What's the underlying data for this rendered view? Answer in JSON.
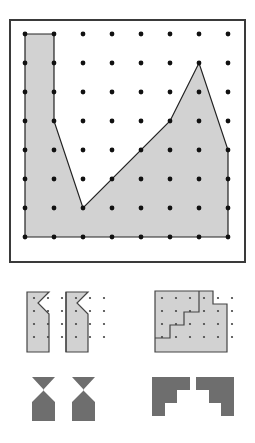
{
  "page": {
    "background_color": "#ffffff"
  },
  "palette": {
    "light_fill": "#d2d2d2",
    "dark_fill": "#6e6e6e",
    "outline": "#222222",
    "frame": "#3a3a3a",
    "dot": "#111111",
    "small_dot": "#444444"
  },
  "main_panel": {
    "label": "main-geoboard-panel",
    "frame": {
      "x": 10,
      "y": 20,
      "width": 235,
      "height": 242,
      "stroke_width": 2
    },
    "grid": {
      "label": "dot-grid",
      "origin_x": 25,
      "origin_y": 34,
      "spacing_x": 29,
      "spacing_y": 29,
      "cols": 8,
      "rows": 8,
      "dot_radius": 2.4
    },
    "polygon": {
      "label": "shaded-polygon",
      "fill": "#d2d2d2",
      "stroke": "#222222",
      "stroke_width": 1.2,
      "grid_vertices": [
        [
          0,
          0
        ],
        [
          1,
          0
        ],
        [
          1,
          3
        ],
        [
          2,
          6
        ],
        [
          5,
          3
        ],
        [
          6,
          1
        ],
        [
          7,
          4
        ],
        [
          7,
          7
        ],
        [
          0,
          7
        ]
      ],
      "vertex_count": 9
    }
  },
  "mid_left_panel": {
    "label": "tessellation-chevron-panel",
    "fill": "#d2d2d2",
    "stroke": "#444444",
    "stroke_width": 1.2,
    "dots": {
      "origin_x": 34,
      "origin_y": 298,
      "spacing_x": 14,
      "spacing_y": 13,
      "cols": 6,
      "rows": 4,
      "dot_radius": 1.1
    },
    "tiles": [
      {
        "label": "chevron-tile-left",
        "points": "27,292 49,292 38,303 49,314 49,352 27,352"
      },
      {
        "label": "chevron-tile-right",
        "points": "66,292 88,292 77,303 88,314 88,352 66,352"
      }
    ],
    "divider": {
      "label": "tile-divider",
      "x1": 66,
      "y1": 292,
      "x2": 66,
      "y2": 352
    }
  },
  "mid_right_panel": {
    "label": "staircase-square-panel",
    "fill": "#d2d2d2",
    "stroke": "#444444",
    "stroke_width": 1.2,
    "dots": {
      "origin_x": 162,
      "origin_y": 298,
      "spacing_x": 14,
      "spacing_y": 13,
      "cols": 6,
      "rows": 4,
      "dot_radius": 1.1
    },
    "outline": {
      "label": "staircase-outer-outline",
      "points": "155,291 213,291 213,304 227,304 227,352 155,352"
    },
    "staircase": {
      "label": "staircase-step-line",
      "points": "155,338 170,338 170,325 184,325 184,312 199,312 199,291"
    }
  },
  "bottom_left_panel": {
    "label": "dark-chevron-pair-panel",
    "fill": "#6e6e6e",
    "shapes": [
      {
        "label": "dark-chevron-left",
        "points": "32,377 55,377 43,390 55,402 55,421 32,421 32,402 44,390"
      },
      {
        "label": "dark-chevron-right",
        "points": "72,377 95,377 83,390 95,402 95,421 72,421 72,402 84,390"
      }
    ]
  },
  "bottom_right_panel": {
    "label": "dark-staircase-pair-panel",
    "fill": "#6e6e6e",
    "shapes": [
      {
        "label": "dark-staircase-left",
        "points": "152,377 190,377 190,390 177,390 177,403 165,403 165,416 152,416"
      },
      {
        "label": "dark-staircase-right",
        "points": "196,377 234,377 234,416 221,416 221,403 209,403 209,390 196,390"
      }
    ]
  }
}
